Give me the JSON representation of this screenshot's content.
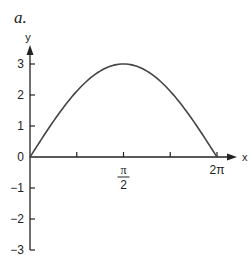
{
  "panel_label": "a.",
  "chart_data": {
    "type": "line",
    "title": "",
    "panel": "a.",
    "xlabel": "x",
    "ylabel": "y",
    "x_ticks": [
      {
        "value": 0,
        "label": "0"
      },
      {
        "value": 0.7854,
        "label": ""
      },
      {
        "value": 1.5708,
        "label": "π/2"
      },
      {
        "value": 2.3562,
        "label": ""
      },
      {
        "value": 3.1416,
        "label": "2π"
      }
    ],
    "y_ticks": [
      -3,
      -2,
      -1,
      0,
      1,
      2,
      3
    ],
    "xlim": [
      0,
      3.1416
    ],
    "ylim": [
      -3,
      3.5
    ],
    "grid": false,
    "legend": null,
    "series": [
      {
        "name": "curve",
        "description": "Arch from (0,0) rising to maximum 3 at the middle label, back to 0 at 2π",
        "x_norm": [
          0,
          0.1,
          0.2,
          0.3,
          0.4,
          0.5,
          0.6,
          0.7,
          0.8,
          0.9,
          1.0
        ],
        "y": [
          0,
          0.93,
          1.76,
          2.43,
          2.85,
          3.0,
          2.85,
          2.43,
          1.76,
          0.93,
          0
        ]
      }
    ],
    "colors": {
      "axis": "#222222",
      "curve": "#444444"
    }
  }
}
